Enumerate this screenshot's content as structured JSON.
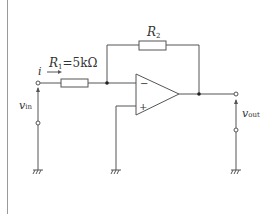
{
  "diagram": {
    "type": "circuit",
    "colors": {
      "line": "#555555",
      "text": "#333333",
      "border": "#9a9a9a",
      "background": "#ffffff"
    },
    "components": {
      "r1": {
        "symbol": "R",
        "sub": "1",
        "value_text": "=5kΩ"
      },
      "r2": {
        "symbol": "R",
        "sub": "2"
      },
      "opamp": {
        "minus": "−",
        "plus": "+"
      }
    },
    "labels": {
      "current": "i",
      "current_arrow": "→",
      "vin_symbol": "v",
      "vin_sub": "in",
      "vout_symbol": "v",
      "vout_sub": "out"
    },
    "grounds": [
      "input-ground",
      "noninverting-ground",
      "output-ground"
    ]
  }
}
